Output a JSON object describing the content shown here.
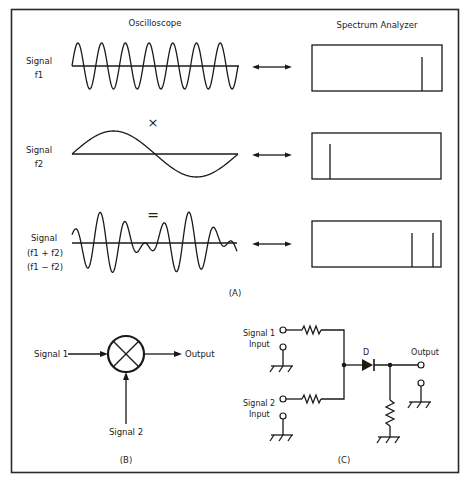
{
  "panel_a": {
    "caption": "(A)",
    "headers": {
      "oscilloscope": "Oscilloscope",
      "spectrum": "Spectrum Analyzer"
    },
    "rows": [
      {
        "label_line1": "Signal",
        "label_line2": "f1",
        "label_line3": "",
        "spectrum_lines_x": [
          422
        ]
      },
      {
        "label_line1": "Signal",
        "label_line2": "f2",
        "label_line3": "",
        "spectrum_lines_x": [
          330
        ]
      },
      {
        "label_line1": "Signal",
        "label_line2": "(f1 + f2)",
        "label_line3": "(f1 − f2)",
        "spectrum_lines_x": [
          412,
          433
        ]
      }
    ],
    "operator_multiply": "×",
    "operator_equals": "="
  },
  "panel_b": {
    "caption": "(B)",
    "input1": "Signal 1",
    "input2": "Signal 2",
    "output": "Output"
  },
  "panel_c": {
    "caption": "(C)",
    "input1_line1": "Signal 1",
    "input1_line2": "Input",
    "input2_line1": "Signal 2",
    "input2_line2": "Input",
    "diode_label": "D",
    "output": "Output"
  },
  "colors": {
    "ink": "#1a1a1a",
    "background": "#ffffff"
  }
}
